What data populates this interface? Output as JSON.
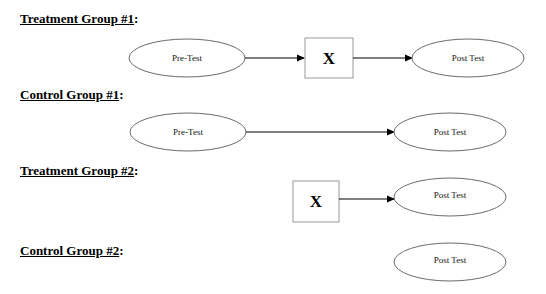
{
  "groups": [
    {
      "title": "Treatment Group #1",
      "suffix": ":",
      "nodes": {
        "pretest": "Pre-Test",
        "treatment": "X",
        "posttest": "Post Test"
      }
    },
    {
      "title": "Control Group #1",
      "suffix": ":",
      "nodes": {
        "pretest": "Pre-Test",
        "posttest": "Post Test"
      }
    },
    {
      "title": "Treatment Group #2",
      "suffix": ":",
      "nodes": {
        "treatment": "X",
        "posttest": "Post Test"
      }
    },
    {
      "title": "Control Group #2",
      "suffix": ":",
      "nodes": {
        "posttest": "Post Test"
      }
    }
  ],
  "colors": {
    "ellipse_stroke": "#6b6b6b",
    "box_stroke": "#9a9a9a",
    "arrow": "#000000",
    "background": "#ffffff"
  }
}
